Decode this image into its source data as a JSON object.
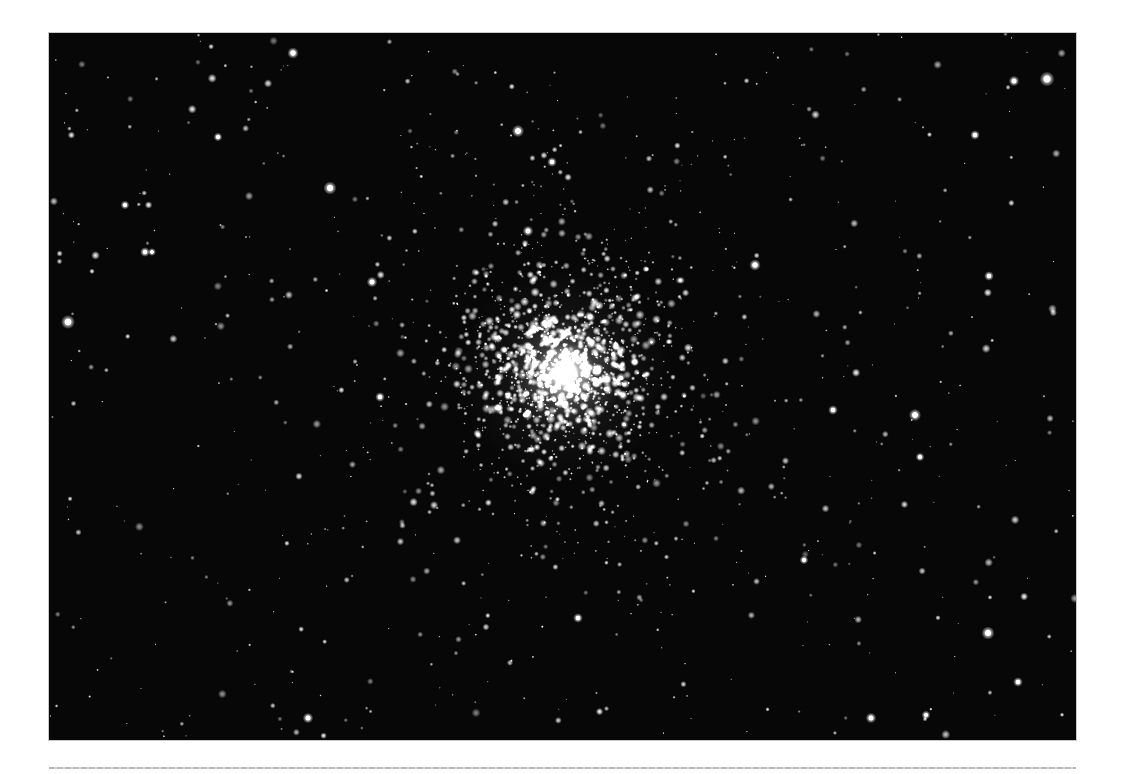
{
  "page": {
    "width": 1122,
    "height": 774,
    "background_color": "#ffffff"
  },
  "photo": {
    "description": "Black-and-white astronomical photograph of a globular star cluster: a dense, bright concentration of hundreds of stars at the center of the frame, surrounded by a scattered field of fainter stars on a black sky",
    "x": 49,
    "y": 33,
    "width": 1027,
    "height": 707,
    "background_color": "#070707",
    "star_color": "#ffffff",
    "render": {
      "seed": 913751,
      "field_stars": {
        "count": 540,
        "min_radius": 0.45,
        "max_radius": 2.1
      },
      "outer_halo": {
        "count": 400,
        "sigma": 118,
        "min_radius": 0.45,
        "max_radius": 1.7
      },
      "inner_halo": {
        "count": 920,
        "sigma": 58,
        "min_radius": 0.55,
        "max_radius": 2.2
      },
      "core_stars": {
        "count": 170,
        "sigma": 27,
        "min_radius": 0.8,
        "max_radius": 2.4
      },
      "cluster_center": {
        "x": 516,
        "y": 340
      },
      "glow_layers": [
        {
          "radius": 108,
          "alpha": 0.1
        },
        {
          "radius": 58,
          "alpha": 0.32
        },
        {
          "radius": 30,
          "alpha": 0.75
        },
        {
          "radius": 14,
          "alpha": 0.95
        }
      ],
      "bright_stars": [
        {
          "x": 244,
          "y": 20,
          "r": 2.6
        },
        {
          "x": 281,
          "y": 155,
          "r": 3.0
        },
        {
          "x": 998,
          "y": 46,
          "r": 3.4
        },
        {
          "x": 965,
          "y": 48,
          "r": 2.4
        },
        {
          "x": 19,
          "y": 289,
          "r": 3.2
        },
        {
          "x": 926,
          "y": 102,
          "r": 2.2
        },
        {
          "x": 469,
          "y": 98,
          "r": 2.8
        },
        {
          "x": 503,
          "y": 129,
          "r": 2.2
        },
        {
          "x": 479,
          "y": 198,
          "r": 2.4
        },
        {
          "x": 169,
          "y": 104,
          "r": 2.0
        },
        {
          "x": 76,
          "y": 172,
          "r": 2.0
        },
        {
          "x": 96,
          "y": 219,
          "r": 2.2
        },
        {
          "x": 103,
          "y": 219,
          "r": 1.8
        },
        {
          "x": 323,
          "y": 249,
          "r": 2.4
        },
        {
          "x": 331,
          "y": 364,
          "r": 2.2
        },
        {
          "x": 706,
          "y": 232,
          "r": 2.6
        },
        {
          "x": 866,
          "y": 382,
          "r": 2.8
        },
        {
          "x": 784,
          "y": 377,
          "r": 2.2
        },
        {
          "x": 871,
          "y": 424,
          "r": 2.0
        },
        {
          "x": 939,
          "y": 600,
          "r": 3.0
        },
        {
          "x": 969,
          "y": 649,
          "r": 2.2
        },
        {
          "x": 822,
          "y": 685,
          "r": 2.4
        },
        {
          "x": 877,
          "y": 682,
          "r": 2.0
        },
        {
          "x": 259,
          "y": 685,
          "r": 2.4
        },
        {
          "x": 529,
          "y": 585,
          "r": 2.2
        },
        {
          "x": 755,
          "y": 527,
          "r": 2.0
        },
        {
          "x": 940,
          "y": 243,
          "r": 2.2
        }
      ]
    }
  },
  "footer_rule": {
    "x": 49,
    "y": 767,
    "width": 1027,
    "color": "#b4b4b4"
  }
}
